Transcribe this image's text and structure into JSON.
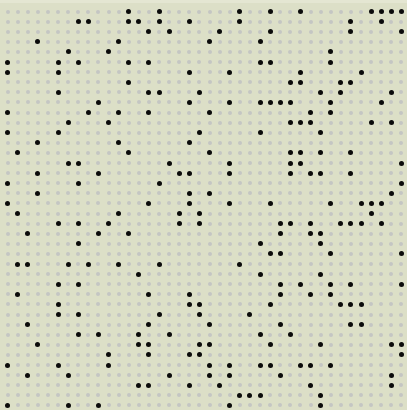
{
  "board": {
    "cols": 40,
    "rows": 40,
    "origin_x": 7.5,
    "origin_y": 11.5,
    "pitch_x": 10.1,
    "pitch_y": 10.1,
    "colors": {
      "background": "#dcdfc7",
      "empty_dot": "#c4c6c3",
      "filled_dot": "#0b0b0b"
    },
    "filled": [
      [
        12,
        15,
        23,
        26,
        29,
        36,
        37,
        38,
        39
      ],
      [
        7,
        8,
        12,
        13,
        15,
        18,
        23,
        34,
        37
      ],
      [
        14,
        16,
        21,
        26,
        34,
        39
      ],
      [
        3,
        11,
        20,
        25
      ],
      [
        6,
        10,
        32
      ],
      [
        0,
        5,
        7,
        12,
        14,
        25,
        26,
        32
      ],
      [
        0,
        5,
        18,
        22,
        29,
        35
      ],
      [
        12,
        28,
        29,
        33,
        34
      ],
      [
        5,
        14,
        15,
        19,
        31,
        33,
        38
      ],
      [
        9,
        18,
        22,
        25,
        26,
        27,
        28,
        32,
        37
      ],
      [
        0,
        8,
        11,
        14,
        20,
        30,
        32
      ],
      [
        6,
        10,
        28,
        29,
        30,
        36,
        38
      ],
      [
        0,
        5,
        19,
        25,
        31
      ],
      [
        3,
        11,
        18
      ],
      [
        1,
        12,
        20,
        28,
        29,
        31,
        34
      ],
      [
        6,
        7,
        16,
        22,
        28,
        29,
        39
      ],
      [
        3,
        9,
        17,
        18,
        22,
        28,
        30,
        31,
        34
      ],
      [
        0,
        7,
        15,
        39
      ],
      [
        3,
        18,
        20,
        38
      ],
      [
        0,
        14,
        18,
        22,
        26,
        32,
        35,
        36,
        37
      ],
      [
        1,
        11,
        17,
        19,
        36
      ],
      [
        5,
        7,
        10,
        17,
        19,
        27,
        28,
        30,
        33,
        34,
        35,
        37
      ],
      [
        2,
        9,
        12,
        27,
        30,
        31
      ],
      [
        7,
        25,
        31
      ],
      [
        26,
        27,
        32,
        39
      ],
      [
        1,
        2,
        6,
        8,
        11,
        15,
        23
      ],
      [
        13,
        25,
        31
      ],
      [
        5,
        7,
        27,
        29,
        32,
        34,
        39
      ],
      [
        1,
        14,
        18,
        27,
        30,
        32
      ],
      [
        5,
        18,
        19,
        26,
        33,
        34,
        35
      ],
      [
        5,
        7,
        15,
        19,
        24
      ],
      [
        2,
        14,
        20,
        27,
        34,
        35
      ],
      [
        7,
        9,
        13,
        16,
        25,
        28
      ],
      [
        3,
        13,
        14,
        19,
        20,
        26,
        31,
        38,
        39
      ],
      [
        10,
        14,
        18,
        19,
        39
      ],
      [
        0,
        5,
        10,
        20,
        22,
        25,
        26,
        29,
        30,
        32
      ],
      [
        2,
        6,
        16,
        20,
        22,
        27,
        38
      ],
      [
        13,
        14,
        18,
        21,
        30,
        38
      ],
      [
        23,
        24,
        25,
        31
      ],
      [
        0,
        6,
        9,
        22,
        31
      ]
    ]
  }
}
